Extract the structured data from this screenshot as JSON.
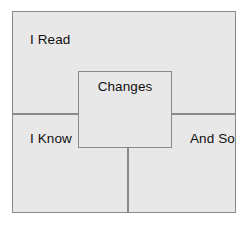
{
  "diagram": {
    "type": "nested-box-diagram",
    "canvas": {
      "width": 248,
      "height": 226,
      "background_color": "#ffffff"
    },
    "style": {
      "fill_color": "#e8e8e8",
      "border_color": "#8a8a8a",
      "text_color": "#111111"
    },
    "outer_box": {
      "name": "outer-frame",
      "label_top_left": "I Read",
      "label_mid_left": "I Know",
      "label_mid_right": "And So"
    },
    "center_box": {
      "name": "changes-box",
      "label": "Changes"
    },
    "dividers": [
      {
        "name": "horizontal-divider",
        "orientation": "horizontal"
      },
      {
        "name": "vertical-divider",
        "orientation": "vertical"
      }
    ]
  }
}
